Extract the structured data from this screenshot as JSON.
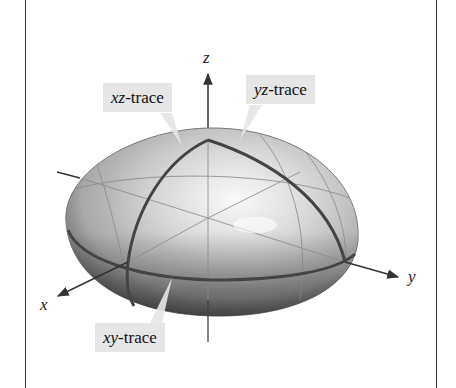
{
  "figure": {
    "title": "",
    "shape": "ellipsoid",
    "axes": {
      "x_label": "x",
      "y_label": "y",
      "z_label": "z"
    },
    "traces": [
      {
        "id": "xz",
        "var": "xz",
        "suffix": "-trace"
      },
      {
        "id": "yz",
        "var": "yz",
        "suffix": "-trace"
      },
      {
        "id": "xy",
        "var": "xy",
        "suffix": "-trace"
      }
    ],
    "colors": {
      "label_bg": "#e6e6e6",
      "trace": "#444444",
      "axis": "#333333",
      "frame": "#333333"
    }
  }
}
